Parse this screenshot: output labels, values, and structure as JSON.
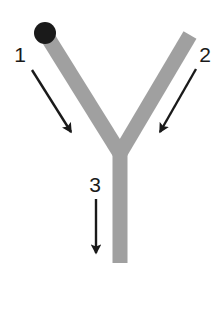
{
  "figure": {
    "type": "labeled-diagram",
    "shape_name": "y-shape",
    "background_color": "#ffffff",
    "structure_color": "#a0a0a0",
    "marker_color": "#1a1a1a",
    "annotation_color": "#1a1a1a"
  },
  "structure": {
    "left_arm": {
      "name": "left-arm",
      "x1": 45,
      "y1": 33,
      "x2": 120,
      "y2": 152,
      "width": 15
    },
    "right_arm": {
      "name": "right-arm",
      "x1": 190,
      "y1": 35,
      "x2": 120,
      "y2": 152,
      "width": 15
    },
    "stem": {
      "name": "stem",
      "x1": 120,
      "y1": 140,
      "x2": 120,
      "y2": 263,
      "width": 15
    },
    "marker_dot": {
      "name": "terminal-dot",
      "cx": 45,
      "cy": 33,
      "r": 11
    }
  },
  "annotations": [
    {
      "id": "1",
      "label": "1",
      "label_x": 20,
      "label_y": 62,
      "arrow_x1": 32,
      "arrow_y1": 70,
      "arrow_x2": 74,
      "arrow_y2": 137,
      "target": "left-arm"
    },
    {
      "id": "2",
      "label": "2",
      "label_x": 205,
      "label_y": 62,
      "arrow_x1": 196,
      "arrow_y1": 69,
      "arrow_x2": 157,
      "arrow_y2": 137,
      "target": "right-arm"
    },
    {
      "id": "3",
      "label": "3",
      "label_x": 95,
      "label_y": 192,
      "arrow_x1": 96,
      "arrow_y1": 199,
      "arrow_x2": 96,
      "arrow_y2": 259,
      "target": "stem"
    }
  ]
}
